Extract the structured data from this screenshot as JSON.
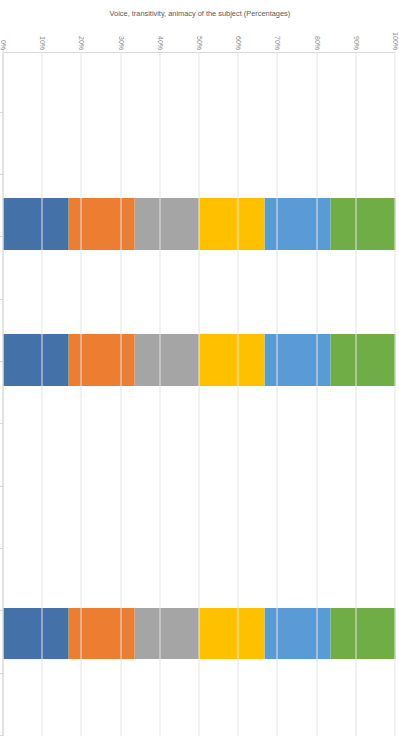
{
  "chart": {
    "y_axis_title": "Voice, transitivity, animacy of the subject (Percentages)",
    "x_axis_title": "English translations of the New Testament (and the Koine Greek NT)",
    "y_ticks": [
      "100%",
      "90%",
      "80%",
      "70%",
      "60%",
      "50%",
      "40%",
      "30%",
      "20%",
      "10%",
      "0%"
    ]
  },
  "chart_data": {
    "type": "bar",
    "title": "",
    "subtitle": "",
    "stacked": false,
    "grouped": true,
    "xlabel": "English translations of the New Testament (and the Koine Greek NT)",
    "ylabel": "Voice, transitivity, animacy of the subject (Percentages)",
    "ylim": [
      0,
      100
    ],
    "ytick_labels": [
      "0%",
      "10%",
      "20%",
      "30%",
      "40%",
      "50%",
      "60%",
      "70%",
      "80%",
      "90%",
      "100%"
    ],
    "grid": true,
    "legend_position": "bottom",
    "categories": [
      "Active anticausative",
      "Non-active/ Marked anticausative",
      "Active transitive",
      "Active animate",
      "Non-active/ Marked animate",
      "Active inanimate",
      "Non-active/ Marked inanimate",
      "Active",
      "Non-active/ Marked"
    ],
    "series": [
      {
        "name": "Wycliffe",
        "color": "#4472a8",
        "values": [
          0,
          0,
          100,
          100,
          0,
          0,
          0,
          100,
          0
        ]
      },
      {
        "name": "Tyndale",
        "color": "#ed7d31",
        "values": [
          0,
          0,
          100,
          100,
          0,
          0,
          0,
          100,
          0
        ]
      },
      {
        "name": "Authorised Version",
        "color": "#a5a5a5",
        "values": [
          0,
          0,
          100,
          100,
          0,
          0,
          0,
          100,
          0
        ]
      },
      {
        "name": "English Revised Version",
        "color": "#ffc000",
        "values": [
          0,
          0,
          100,
          100,
          0,
          0,
          0,
          100,
          0
        ]
      },
      {
        "name": "English Standard Version",
        "color": "#5b9bd5",
        "values": [
          0,
          0,
          100,
          100,
          0,
          0,
          0,
          100,
          0
        ]
      },
      {
        "name": "Koine Greek NT",
        "color": "#70ad47",
        "values": [
          0,
          0,
          100,
          100,
          0,
          0,
          0,
          100,
          0
        ]
      }
    ],
    "data_table": {
      "column_headers": [
        "Active anticausative",
        "Non-active/ Marked anticausative",
        "Active transitive",
        "Active anticausative",
        "Active animate",
        "Non-active/ Marked animate",
        "Active inanimate",
        "Non-active/ Marked inanimate",
        "Active",
        "Non-active/ Marked"
      ],
      "rows": [
        {
          "label": "Wycliffe",
          "color": "#4472a8",
          "values": [
            "0.00%",
            "0.00%",
            "100.00%",
            "0.00%",
            "100.00%",
            "0.00%",
            "0.00%",
            "0.00%",
            "100.00%",
            "0.00%"
          ]
        },
        {
          "label": "Tyndale",
          "color": "#ed7d31",
          "values": [
            "0.00%",
            "0.00%",
            "100.00%",
            "0.00%",
            "100.00%",
            "0.00%",
            "0.00%",
            "0.00%",
            "100.00%",
            "0.00%"
          ]
        },
        {
          "label": "Authorised Version",
          "color": "#a5a5a5",
          "values": [
            "0.00%",
            "0.00%",
            "100.00%",
            "0.00%",
            "100.00%",
            "0.00%",
            "0.00%",
            "0.00%",
            "100.00%",
            "0.00%"
          ]
        },
        {
          "label": "English Revised Version",
          "color": "#ffc000",
          "values": [
            "0.00%",
            "0.00%",
            "100.00%",
            "0.00%",
            "100.00%",
            "0.00%",
            "0.00%",
            "0.00%",
            "100.00%",
            "0.00%"
          ]
        },
        {
          "label": "English Standard Version",
          "color": "#5b9bd5",
          "values": [
            "0.00%",
            "0.00%",
            "100.00%",
            "0.00%",
            "100.00%",
            "0.00%",
            "0.00%",
            "0.00%",
            "100.00%",
            "0.00%"
          ]
        },
        {
          "label": "Koine Greek NT",
          "color": "#70ad47",
          "values": [
            "0.00%",
            "0.00%",
            "100.00%",
            "0.00%",
            "100.00%",
            "0.00%",
            "0.00%",
            "0.00%",
            "100.00%",
            "0.00%"
          ]
        }
      ]
    }
  }
}
